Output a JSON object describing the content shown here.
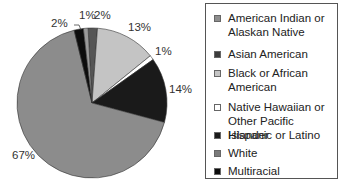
{
  "chart_data": {
    "type": "pie",
    "title": "",
    "start_angle_deg": -3,
    "direction": "clockwise",
    "slices": [
      {
        "name": "Asian American",
        "value": 2,
        "label": "2%",
        "color": "#555555"
      },
      {
        "name": "Black or African American",
        "value": 13,
        "label": "13%",
        "color": "#c4c4c4"
      },
      {
        "name": "Native Hawaiian or Other Pacific Islander",
        "value": 1,
        "label": "1%",
        "color": "#ffffff"
      },
      {
        "name": "Hispanic or Latino",
        "value": 14,
        "label": "14%",
        "color": "#1a1a1a"
      },
      {
        "name": "White",
        "value": 67,
        "label": "67%",
        "color": "#8c8c8c"
      },
      {
        "name": "Multiracial",
        "value": 2,
        "label": "2%",
        "color": "#0d0d0d"
      },
      {
        "name": "American Indian or Alaskan Native",
        "value": 1,
        "label": "1%",
        "color": "#9a9a9a"
      }
    ],
    "legend_position": "right",
    "legend": [
      {
        "label": "American Indian or Alaskan Native",
        "lines": [
          "American Indian or",
          "Alaskan Native"
        ],
        "color": "#8e8e8e"
      },
      {
        "label": "Asian American",
        "lines": [
          "Asian American"
        ],
        "color": "#3c3c3c"
      },
      {
        "label": "Black or African American",
        "lines": [
          "Black or African",
          "American"
        ],
        "color": "#c4c4c4"
      },
      {
        "label": "Native Hawaiian or Other Pacific Islander",
        "lines": [
          "Native Hawaiian or",
          "Other Pacific Islander"
        ],
        "color": "#ffffff"
      },
      {
        "label": "Hispanic or Latino",
        "lines": [
          "Hispanic or Latino"
        ],
        "color": "#1a1a1a"
      },
      {
        "label": "White",
        "lines": [
          "White"
        ],
        "color": "#7a7a7a"
      },
      {
        "label": "Multiracial",
        "lines": [
          "Multiracial"
        ],
        "color": "#0d0d0d"
      }
    ]
  },
  "labels": {
    "multiracial": "2%",
    "american_indian": "1%",
    "asian": "2%",
    "black": "13%",
    "native_hawaiian": "1%",
    "hispanic": "14%",
    "white": "67%"
  },
  "legend": {
    "items": [
      {
        "line1": "American Indian or",
        "line2": "Alaskan Native"
      },
      {
        "line1": "Asian American",
        "line2": ""
      },
      {
        "line1": "Black or African",
        "line2": "American"
      },
      {
        "line1": "Native Hawaiian or",
        "line2": "Other Pacific Islander"
      },
      {
        "line1": "Hispanic or Latino",
        "line2": ""
      },
      {
        "line1": "White",
        "line2": ""
      },
      {
        "line1": "Multiracial",
        "line2": ""
      }
    ]
  }
}
